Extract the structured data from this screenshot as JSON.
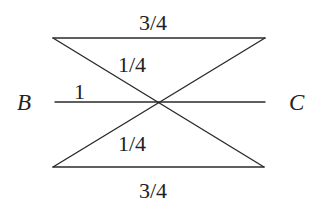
{
  "diagram": {
    "points": {
      "B": {
        "label": "B"
      },
      "C": {
        "label": "C"
      }
    },
    "labels": {
      "top_segment": "3/4",
      "upper_diagonal": "1/4",
      "left_baseline": "1",
      "lower_diagonal": "1/4",
      "bottom_segment": "3/4"
    },
    "segments": [
      {
        "name": "top-horizontal",
        "from": [
          53,
          38
        ],
        "to": [
          265,
          38
        ]
      },
      {
        "name": "diagonal-topleft-to-bottomright",
        "from": [
          53,
          38
        ],
        "to": [
          264,
          167
        ]
      },
      {
        "name": "diagonal-topright-to-bottomleft",
        "from": [
          265,
          38
        ],
        "to": [
          53,
          167
        ]
      },
      {
        "name": "line-BC",
        "from": [
          55,
          102
        ],
        "to": [
          265,
          102
        ]
      },
      {
        "name": "bottom-horizontal",
        "from": [
          53,
          167
        ],
        "to": [
          264,
          167
        ]
      }
    ],
    "crossing_point": [
      159,
      102
    ],
    "line_color": "#2b2b2b",
    "text_color": "#222222"
  }
}
